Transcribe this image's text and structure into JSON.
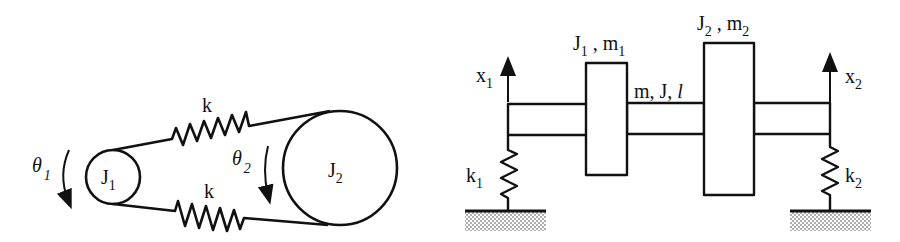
{
  "left_diagram": {
    "title": "Two pulleys connected by spring belts",
    "pulley_small": {
      "label": "J",
      "subscript": "1"
    },
    "pulley_large": {
      "label": "J",
      "subscript": "2"
    },
    "spring_top": {
      "label": "k"
    },
    "spring_bottom": {
      "label": "k"
    },
    "rotation_1": {
      "label": "θ",
      "subscript": "1"
    },
    "rotation_2": {
      "label": "θ",
      "subscript": "2"
    }
  },
  "right_diagram": {
    "title": "Shaft with two disks on spring supports",
    "disk_1": {
      "label": "J",
      "sub1": "1",
      "sep": " , ",
      "label2": "m",
      "sub2": "1"
    },
    "disk_2": {
      "label": "J",
      "sub1": "2",
      "sep": " , ",
      "label2": "m",
      "sub2": "2"
    },
    "shaft": {
      "label": "m, J, ",
      "label_italic": "l"
    },
    "spring_left": {
      "label": "k",
      "subscript": "1"
    },
    "spring_right": {
      "label": "k",
      "subscript": "2"
    },
    "displacement_left": {
      "label": "x",
      "subscript": "1"
    },
    "displacement_right": {
      "label": "x",
      "subscript": "2"
    }
  },
  "colors": {
    "ink": "#111111",
    "background": "#ffffff",
    "ground_hatch": "#9a9a9a"
  }
}
